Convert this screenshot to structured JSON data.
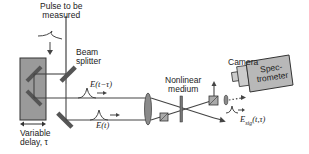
{
  "labels": {
    "pulse": [
      "Pulse to be",
      "measured"
    ],
    "beam_splitter": [
      "Beam",
      "splitter"
    ],
    "variable_delay": [
      "Variable",
      "delay, τ"
    ],
    "nonlinear_medium": [
      "Nonlinear",
      "medium"
    ],
    "camera": "Camera",
    "spectrometer": [
      "Spec-",
      "trometer"
    ],
    "field_delayed": "E(t−τ)",
    "field": "E(t)",
    "field_signal": "E",
    "field_signal_sub": "sig",
    "field_signal_args": "(t,τ)"
  },
  "colors": {
    "line": "#444444",
    "delay_stage": "#9a9a9a",
    "mirror": "#555555",
    "lens": "#8a8a8a",
    "spectrometer": "#b8b8b8"
  }
}
